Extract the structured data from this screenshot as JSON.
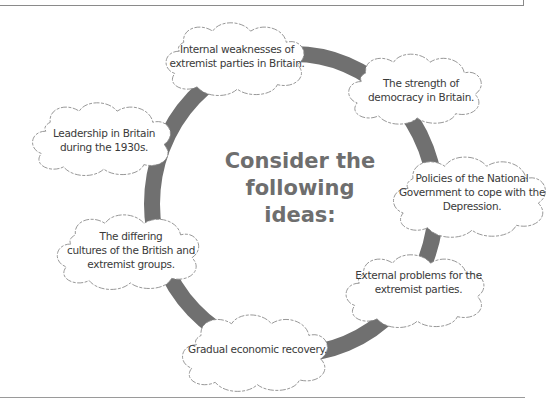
{
  "title": {
    "lines": [
      "Consider the",
      "following",
      "ideas:"
    ]
  },
  "ideas": [
    {
      "id": "internal-weaknesses",
      "lines": [
        "Internal weaknesses of",
        "extremist parties in Britain."
      ]
    },
    {
      "id": "strength-of-democracy",
      "lines": [
        "The strength of",
        "democracy in Britain."
      ]
    },
    {
      "id": "national-government-policies",
      "lines": [
        "Policies of the National",
        "Government to cope with the",
        "Depression."
      ]
    },
    {
      "id": "external-problems",
      "lines": [
        "External problems for the",
        "extremist parties."
      ]
    },
    {
      "id": "economic-recovery",
      "lines": [
        "Gradual economic recovery."
      ]
    },
    {
      "id": "differing-cultures",
      "lines": [
        "The differing",
        "cultures of the British and",
        "extremist groups."
      ]
    },
    {
      "id": "leadership",
      "lines": [
        "Leadership in Britain",
        "during the 1930s."
      ]
    }
  ],
  "colors": {
    "ring": "#707070",
    "title": "#6e6e6e",
    "cloud_stroke": "#8c8c8c",
    "text": "#3a3a3a"
  }
}
